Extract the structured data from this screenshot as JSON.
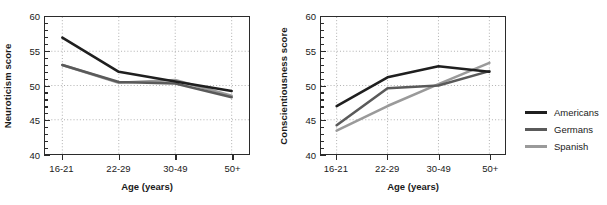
{
  "chart_data": [
    {
      "type": "line",
      "title": "",
      "xlabel": "Age (years)",
      "ylabel": "Neuroticism score",
      "categories": [
        "16-21",
        "22-29",
        "30-49",
        "50+"
      ],
      "ylim": [
        40,
        60
      ],
      "yticks": [
        40,
        45,
        50,
        55,
        60
      ],
      "ytick_labels": [
        "40",
        "45",
        "50",
        "55",
        "60"
      ],
      "grid": true,
      "legend_position": "right-outside",
      "series": [
        {
          "name": "Americans",
          "color": "#1f1f1f",
          "values": [
            57.0,
            52.0,
            50.6,
            49.2
          ]
        },
        {
          "name": "Germans",
          "color": "#5a5a5a",
          "values": [
            53.0,
            50.5,
            50.3,
            48.3
          ]
        },
        {
          "name": "Spanish",
          "color": "#9a9a9a",
          "values": [
            53.0,
            50.4,
            50.8,
            48.5
          ]
        }
      ]
    },
    {
      "type": "line",
      "title": "",
      "xlabel": "Age (years)",
      "ylabel": "Conscientiousness score",
      "categories": [
        "16-21",
        "22-29",
        "30-49",
        "50+"
      ],
      "ylim": [
        40,
        60
      ],
      "yticks": [
        40,
        45,
        50,
        55,
        60
      ],
      "ytick_labels": [
        "40",
        "45",
        "50",
        "55",
        "60"
      ],
      "grid": true,
      "legend_position": "right-outside",
      "series": [
        {
          "name": "Americans",
          "color": "#1f1f1f",
          "values": [
            47.0,
            51.2,
            52.8,
            52.0
          ]
        },
        {
          "name": "Germans",
          "color": "#5a5a5a",
          "values": [
            44.2,
            49.6,
            50.0,
            52.1
          ]
        },
        {
          "name": "Spanish",
          "color": "#9a9a9a",
          "values": [
            43.4,
            47.0,
            50.2,
            53.3
          ]
        }
      ]
    }
  ],
  "legend": {
    "items": [
      {
        "label": "Americans",
        "color": "#1f1f1f"
      },
      {
        "label": "Germans",
        "color": "#5a5a5a"
      },
      {
        "label": "Spanish",
        "color": "#9a9a9a"
      }
    ]
  }
}
